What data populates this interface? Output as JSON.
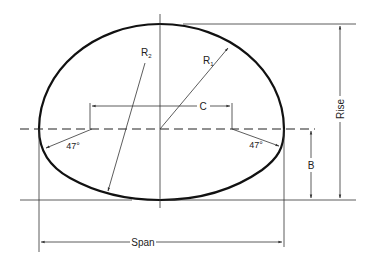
{
  "diagram": {
    "colors": {
      "outline": "#111111",
      "line": "#333333",
      "background": "#ffffff"
    },
    "labels": {
      "r1_main": "R",
      "r1_sub": "1",
      "r2_main": "R",
      "r2_sub": "2",
      "c": "C",
      "b": "B",
      "rise": "Rise",
      "span": "Span",
      "angle_left": "47°",
      "angle_right": "47°"
    },
    "dimensions": [
      {
        "name": "Span",
        "description": "overall horizontal width"
      },
      {
        "name": "Rise",
        "description": "overall vertical height"
      },
      {
        "name": "B",
        "description": "height from bottom to springline"
      },
      {
        "name": "C",
        "description": "distance between corner-radius centers"
      },
      {
        "name": "R1",
        "description": "top radius"
      },
      {
        "name": "R2",
        "description": "bottom radius"
      }
    ],
    "angles_deg": [
      47,
      47
    ]
  }
}
